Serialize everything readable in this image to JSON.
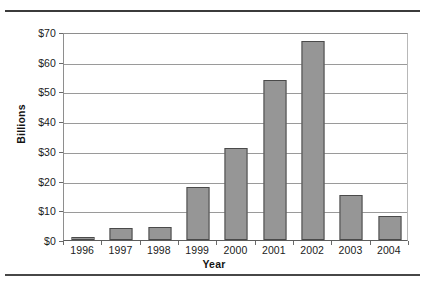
{
  "chart_data": {
    "type": "bar",
    "title": "",
    "subtitle": "",
    "xlabel": "Year",
    "ylabel": "Billions",
    "categories": [
      "1996",
      "1997",
      "1998",
      "1999",
      "2000",
      "2001",
      "2002",
      "2003",
      "2004"
    ],
    "values": [
      1,
      4,
      4.5,
      18,
      31,
      54,
      67,
      15,
      8
    ],
    "series": [
      {
        "name": "",
        "values": [
          1,
          4,
          4.5,
          18,
          31,
          54,
          67,
          15,
          8
        ]
      }
    ],
    "ylim": [
      0,
      70
    ],
    "ytick_values": [
      0,
      10,
      20,
      30,
      40,
      50,
      60,
      70
    ],
    "ytick_labels": [
      "$0",
      "$10",
      "$20",
      "$30",
      "$40",
      "$50",
      "$60",
      "$70"
    ],
    "grid": true,
    "grid_axis": "y",
    "legend": false,
    "legend_position": "none",
    "annotations": [],
    "bar_color": "#969696",
    "bar_edge_color": "#4a4a4a",
    "grid_color": "#9a9a9a",
    "axis_color": "#5c5c5c",
    "background_color": "#ffffff",
    "text_color": "#1b1b1b"
  },
  "figure": {
    "top_rule": "",
    "bottom_rule": ""
  }
}
